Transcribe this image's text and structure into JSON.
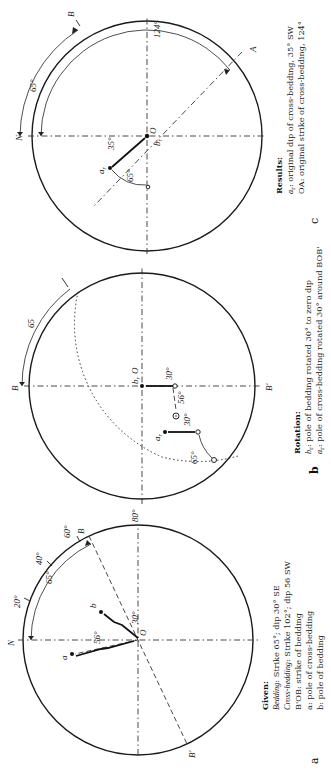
{
  "figure": {
    "orientation": "rotated-90-ccw",
    "panels": [
      {
        "id": "a",
        "panel_label": "a",
        "labels": {
          "north": "N",
          "strike_end": "B",
          "strike_end_opposite": "B'",
          "center": "O",
          "pole_cross": "a",
          "pole_bed": "b",
          "dip_cross": "56°",
          "dip_bed": "30°",
          "tick_20": "20°",
          "tick_40": "40°",
          "tick_60": "60°",
          "tick_80": "80°",
          "strike_arc": "65°"
        },
        "caption": {
          "heading": "Given:",
          "line1_term": "Bedding",
          "line1_text": ": Strike 65°; dip 30° SE",
          "line2_term": "Cross-bedding",
          "line2_text": ": Strike 102°; dip 56 SW",
          "line3": "B'OB: strike of bedding",
          "line4": "a: pole of cross-bedding",
          "line5": "b: pole of bedding"
        }
      },
      {
        "id": "b",
        "panel_label": "b",
        "labels": {
          "strike_end": "B",
          "strike_end_opposite": "B'",
          "center": "O",
          "rotated_bed": "b",
          "rotated_bed_sub": "r",
          "rotated_cross": "a",
          "rotated_cross_sub": "r",
          "arc_65": "65",
          "rot_65": "65°",
          "rot_30_a": "30°",
          "rot_30_b": "30°",
          "dip_56": "56°"
        },
        "caption": {
          "heading": "Rotation:",
          "line1_term": "b",
          "line1_sub": "r",
          "line1_text": ": pole of bedding rotated 30° to zero dip",
          "line2_term": "a",
          "line2_sub": "r",
          "line2_text": ": pole of cross-bedding rotated 30° around BOB'"
        }
      },
      {
        "id": "c",
        "panel_label": "c",
        "labels": {
          "north": "N",
          "strike_end": "B",
          "strike_end_a": "A",
          "center": "O",
          "pole_cross_r": "a",
          "pole_cross_r_sub": "r",
          "pole_bed_r": "b",
          "pole_bed_r_sub": "r",
          "arc_65": "65°",
          "arc_124": "124°",
          "dip_35": "35°",
          "rot_65": "65°"
        },
        "caption": {
          "heading": "Results:",
          "line1_term": "a",
          "line1_sub": "r",
          "line1_text": ": original dip of cross-bedding, 35° SW",
          "line2": "OA: original strike of cross-bedding, 124°"
        }
      }
    ]
  }
}
